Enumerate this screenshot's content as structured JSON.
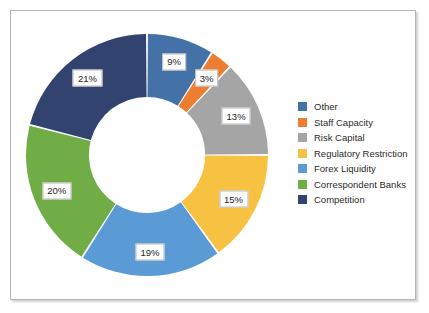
{
  "frame": {
    "border_color": "#b6b6b6",
    "background": "#ffffff"
  },
  "chart_data": {
    "type": "pie",
    "variant": "donut",
    "title": "",
    "xlabel": "",
    "ylabel": "",
    "grid": false,
    "legend_position": "right",
    "start_angle_deg": 0,
    "direction": "clockwise",
    "inner_radius_ratio": 0.48,
    "units": "percent",
    "total": 100,
    "categories": [
      "Other",
      "Staff Capacity",
      "Risk Capital",
      "Regulatory Restriction",
      "Forex Liquidity",
      "Correspondent Banks",
      "Competition"
    ],
    "values": [
      9,
      3,
      13,
      15,
      19,
      20,
      21
    ],
    "data_labels": [
      "9%",
      "3%",
      "13%",
      "15%",
      "19%",
      "20%",
      "21%"
    ],
    "colors": [
      "#4472a8",
      "#ed7d31",
      "#a5a5a5",
      "#f7c242",
      "#5b9bd5",
      "#70ad47",
      "#32436f"
    ]
  },
  "legend": {
    "items": [
      {
        "label": "Other",
        "color": "#4472a8"
      },
      {
        "label": "Staff Capacity",
        "color": "#ed7d31"
      },
      {
        "label": "Risk Capital",
        "color": "#a5a5a5"
      },
      {
        "label": "Regulatory Restriction",
        "color": "#f7c242"
      },
      {
        "label": "Forex Liquidity",
        "color": "#5b9bd5"
      },
      {
        "label": "Correspondent Banks",
        "color": "#70ad47"
      },
      {
        "label": "Competition",
        "color": "#32436f"
      }
    ]
  }
}
